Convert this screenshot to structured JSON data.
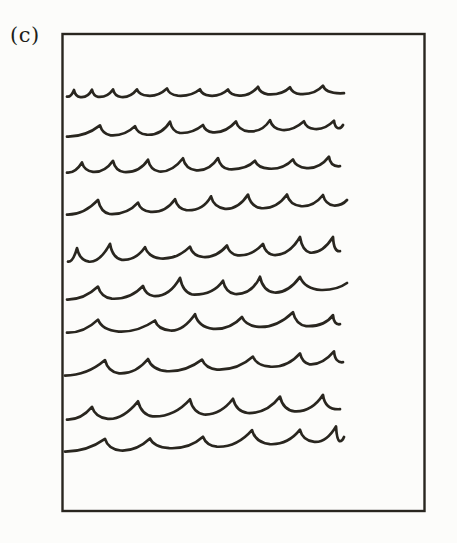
{
  "figure": {
    "panel_label": "(c)",
    "background_color": "#fcfcfa",
    "ink_color": "#29261f",
    "canvas": {
      "width": 457,
      "height": 543
    },
    "box": {
      "x": 62.5,
      "y": 34,
      "width": 362,
      "height": 477,
      "stroke_width": 2.4
    },
    "waves": {
      "stroke_width": 2.7,
      "rows": [
        {
          "y_left": 96,
          "y_right": 93,
          "x_start": 67,
          "x_end": 344,
          "amplitude": 6,
          "seed": 11,
          "end_tip": 0,
          "crests": [
            74,
            92,
            113,
            137,
            167,
            200,
            228,
            258,
            290,
            323
          ]
        },
        {
          "y_left": 136,
          "y_right": 127,
          "x_start": 67,
          "x_end": 343,
          "amplitude": 9,
          "seed": 22,
          "end_tip": 2,
          "crests": [
            100,
            135,
            170,
            203,
            236,
            270,
            304,
            334
          ]
        },
        {
          "y_left": 172,
          "y_right": 166,
          "x_start": 67,
          "x_end": 340,
          "amplitude": 9,
          "seed": 33,
          "end_tip": 0,
          "crests": [
            82,
            113,
            148,
            183,
            218,
            255,
            293,
            329
          ]
        },
        {
          "y_left": 214,
          "y_right": 204,
          "x_start": 67,
          "x_end": 347,
          "amplitude": 11,
          "seed": 44,
          "end_tip": 4,
          "crests": [
            98,
            138,
            175,
            211,
            248,
            287,
            323
          ]
        },
        {
          "y_left": 261,
          "y_right": 251,
          "x_start": 68,
          "x_end": 340,
          "amplitude": 13,
          "seed": 55,
          "end_tip": 0,
          "crests": [
            77,
            110,
            145,
            190,
            227,
            263,
            300,
            333
          ]
        },
        {
          "y_left": 299,
          "y_right": 288,
          "x_start": 67,
          "x_end": 347,
          "amplitude": 14,
          "seed": 66,
          "end_tip": 5,
          "crests": [
            98,
            143,
            180,
            223,
            260,
            300
          ]
        },
        {
          "y_left": 332,
          "y_right": 324,
          "x_start": 67,
          "x_end": 340,
          "amplitude": 12,
          "seed": 77,
          "end_tip": 0,
          "crests": [
            98,
            155,
            195,
            242,
            293,
            333
          ]
        },
        {
          "y_left": 375,
          "y_right": 362,
          "x_start": 65,
          "x_end": 343,
          "amplitude": 11,
          "seed": 88,
          "end_tip": 0,
          "crests": [
            105,
            148,
            202,
            253,
            300,
            334
          ]
        },
        {
          "y_left": 419,
          "y_right": 409,
          "x_start": 67,
          "x_end": 340,
          "amplitude": 13,
          "seed": 99,
          "end_tip": 0,
          "crests": [
            92,
            138,
            190,
            233,
            280,
            323
          ]
        },
        {
          "y_left": 451,
          "y_right": 440,
          "x_start": 65,
          "x_end": 344,
          "amplitude": 12,
          "seed": 12,
          "end_tip": 3,
          "crests": [
            105,
            150,
            203,
            252,
            300,
            336
          ]
        }
      ]
    }
  }
}
